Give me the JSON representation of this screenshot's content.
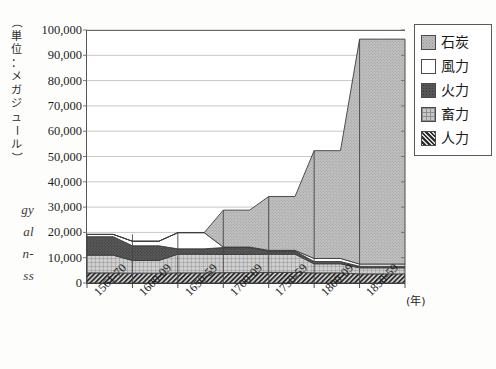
{
  "page": {
    "margin_fragments": [
      "gy",
      "al",
      "n-",
      "ss"
    ]
  },
  "chart_data": {
    "type": "area",
    "title": "",
    "subtitle": "",
    "xlabel": "(年)",
    "ylabel": "（単位：メガジュール）",
    "ylabel_chars": [
      "（",
      "単",
      "位",
      "：",
      "メ",
      "ガ",
      "ジ",
      "ュ",
      "ー",
      "ル",
      "）"
    ],
    "categories": [
      "1561-70",
      "1600-09",
      "1650-59",
      "1700-09",
      "1750-59",
      "1800-09",
      "1850-59"
    ],
    "ylim": [
      0,
      100000
    ],
    "ytick_values": [
      0,
      10000,
      20000,
      30000,
      40000,
      50000,
      60000,
      70000,
      80000,
      90000,
      100000
    ],
    "ytick_labels": [
      "0",
      "10,000",
      "20,000",
      "30,000",
      "40,000",
      "50,000",
      "60,000",
      "70,000",
      "80,000",
      "90,000",
      "100,000"
    ],
    "grid": true,
    "legend_position": "right",
    "stacked": true,
    "stack_order_bottom_to_top": [
      "人力",
      "畜力",
      "火力",
      "風力",
      "石炭"
    ],
    "series": [
      {
        "name": "人力",
        "name_en": "human power",
        "color": "#4c4c4c",
        "pattern": "diagonal-hatch",
        "values": [
          4000,
          3900,
          4000,
          4100,
          4200,
          4000,
          3600
        ]
      },
      {
        "name": "畜力",
        "name_en": "animal power",
        "color": "#c9c9c9",
        "pattern": "cross-grid",
        "values": [
          7000,
          5000,
          7400,
          7200,
          7200,
          3600,
          2400
        ]
      },
      {
        "name": "火力",
        "name_en": "thermal / fire power",
        "color": "#565656",
        "pattern": "dark-stipple",
        "values": [
          7300,
          5800,
          2100,
          2700,
          1200,
          900,
          600
        ]
      },
      {
        "name": "風力",
        "name_en": "wind power",
        "color": "#ffffff",
        "pattern": "solid-white",
        "values": [
          900,
          1800,
          6400,
          200,
          300,
          1200,
          900
        ]
      },
      {
        "name": "石炭",
        "name_en": "coal",
        "color": "#bcbcbc",
        "pattern": "light-stipple",
        "values": [
          0,
          0,
          0,
          14600,
          21300,
          42600,
          88900
        ]
      }
    ],
    "totals": [
      19200,
      16500,
      19900,
      28800,
      34200,
      52300,
      96400
    ],
    "annotations": []
  },
  "legend": {
    "items": [
      {
        "label": "石炭",
        "swatch": "f-coal"
      },
      {
        "label": "風力",
        "swatch": "f-wind"
      },
      {
        "label": "火力",
        "swatch": "f-thermal"
      },
      {
        "label": "畜力",
        "swatch": "f-animal"
      },
      {
        "label": "人力",
        "swatch": "f-human"
      }
    ]
  }
}
